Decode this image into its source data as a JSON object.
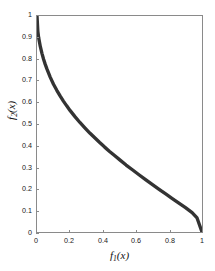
{
  "chart_data": {
    "type": "line",
    "title": "",
    "subtitle": "",
    "xlabel": "f_1(x)",
    "ylabel": "f_2(x)",
    "xlabel_base": "f",
    "xlabel_sub": "1",
    "xlabel_arg": "(x)",
    "ylabel_base": "f",
    "ylabel_sub": "2",
    "ylabel_arg": "(x)",
    "xlim": [
      0,
      1
    ],
    "ylim": [
      0,
      1
    ],
    "grid": false,
    "legend": null,
    "legend_position": "none",
    "line_color": "#333333",
    "line_width": 3,
    "xticks": [
      0,
      0.2,
      0.4,
      0.6,
      0.8,
      1
    ],
    "xtick_labels": [
      "0",
      "0.2",
      "0.4",
      "0.6",
      "0.8",
      "1"
    ],
    "yticks": [
      0,
      0.1,
      0.2,
      0.3,
      0.4,
      0.5,
      0.6,
      0.7,
      0.8,
      0.9,
      1
    ],
    "ytick_labels": [
      "0",
      "0.1",
      "0.2",
      "0.3",
      "0.4",
      "0.5",
      "0.6",
      "0.7",
      "0.8",
      "0.9",
      "1"
    ],
    "series": [
      {
        "name": "Pareto front",
        "x": [
          0.0,
          0.005,
          0.01,
          0.02,
          0.03,
          0.04,
          0.05,
          0.06,
          0.08,
          0.1,
          0.12,
          0.14,
          0.16,
          0.18,
          0.2,
          0.23,
          0.26,
          0.29,
          0.32,
          0.35,
          0.38,
          0.41,
          0.44,
          0.47,
          0.5,
          0.54,
          0.58,
          0.62,
          0.66,
          0.7,
          0.74,
          0.78,
          0.82,
          0.86,
          0.9,
          0.94,
          0.97,
          1.0
        ],
        "y": [
          1.0,
          0.93,
          0.9,
          0.859,
          0.827,
          0.8,
          0.776,
          0.755,
          0.717,
          0.684,
          0.656,
          0.63,
          0.606,
          0.584,
          0.563,
          0.534,
          0.507,
          0.482,
          0.458,
          0.436,
          0.414,
          0.393,
          0.373,
          0.354,
          0.335,
          0.31,
          0.287,
          0.264,
          0.241,
          0.219,
          0.197,
          0.176,
          0.155,
          0.134,
          0.113,
          0.09,
          0.065,
          0.0
        ]
      }
    ],
    "annotations": []
  },
  "axes": {
    "box_color": "#8a8a8a"
  }
}
